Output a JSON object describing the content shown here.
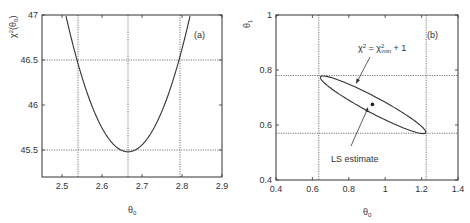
{
  "chart_data": [
    {
      "type": "line",
      "panel_label": "(a)",
      "title": "",
      "xlabel": "θ0",
      "ylabel": "χ²(θ0)",
      "xlim": [
        2.45,
        2.9
      ],
      "ylim": [
        45.2,
        47.0
      ],
      "x_ticks": [
        "2.5",
        "2.6",
        "2.7",
        "2.8",
        "2.9"
      ],
      "y_ticks": [
        "45.5",
        "46",
        "46.5",
        "47"
      ],
      "grid": false,
      "series": [
        {
          "name": "χ²(θ0) profile",
          "x": [
            2.5,
            2.54,
            2.58,
            2.62,
            2.665,
            2.71,
            2.75,
            2.795,
            2.82
          ],
          "y": [
            47.0,
            46.5,
            46.07,
            45.7,
            45.48,
            45.6,
            45.93,
            46.5,
            47.0
          ]
        }
      ],
      "reference_lines": {
        "horizontal": [
          46.5,
          45.5
        ],
        "vertical": [
          2.54,
          2.665,
          2.795
        ]
      },
      "minimum": {
        "x": 2.665,
        "y": 45.48
      }
    },
    {
      "type": "scatter",
      "panel_label": "(b)",
      "title": "",
      "xlabel": "θ0",
      "ylabel": "θ1",
      "xlim": [
        0.4,
        1.4
      ],
      "ylim": [
        0.4,
        1.0
      ],
      "x_ticks": [
        "0.4",
        "0.6",
        "0.8",
        "1",
        "1.2",
        "1.4"
      ],
      "y_ticks": [
        "0.4",
        "0.6",
        "0.8",
        "1"
      ],
      "grid": false,
      "series": [
        {
          "name": "LS estimate",
          "x": [
            0.93
          ],
          "y": [
            0.675
          ]
        },
        {
          "name": "χ² = χ²min + 1 contour (ellipse)",
          "x": [
            0.635,
            0.66,
            0.85,
            1.05,
            1.2,
            1.225,
            1.2,
            1.0,
            0.8,
            0.65,
            0.635
          ],
          "y": [
            0.765,
            0.78,
            0.73,
            0.655,
            0.59,
            0.57,
            0.57,
            0.615,
            0.68,
            0.75,
            0.765
          ]
        }
      ],
      "reference_lines": {
        "horizontal": [
          0.78,
          0.57
        ],
        "vertical": [
          0.635,
          1.225
        ]
      },
      "annotations": [
        "χ² = χ²min + 1",
        "LS estimate"
      ]
    }
  ],
  "panel_a": {
    "label": "(a)",
    "xlabel_main": "θ",
    "xlabel_sub": "0",
    "ylabel_main": "χ",
    "ylabel_sup": "2",
    "ylabel_arg": "(θ",
    "ylabel_arg_sub": "0",
    "ylabel_close": ")",
    "x_ticks": [
      {
        "label": "2.5",
        "value": 2.5
      },
      {
        "label": "2.6",
        "value": 2.6
      },
      {
        "label": "2.7",
        "value": 2.7
      },
      {
        "label": "2.8",
        "value": 2.8
      },
      {
        "label": "2.9",
        "value": 2.9
      }
    ],
    "y_ticks": [
      {
        "label": "45.5",
        "value": 45.5
      },
      {
        "label": "46",
        "value": 46.0
      },
      {
        "label": "46.5",
        "value": 46.5
      },
      {
        "label": "47",
        "value": 47.0
      }
    ]
  },
  "panel_b": {
    "label": "(b)",
    "xlabel_main": "θ",
    "xlabel_sub": "0",
    "ylabel_main": "θ",
    "ylabel_sub": "1",
    "contour_annotation_chi": "χ",
    "contour_annotation_sup": "2",
    "contour_annotation_eq": " = χ",
    "contour_annotation_sup2": "2",
    "contour_annotation_sub": "min",
    "contour_annotation_tail": " + 1",
    "estimate_annotation": "LS estimate",
    "x_ticks": [
      {
        "label": "0.4",
        "value": 0.4
      },
      {
        "label": "0.6",
        "value": 0.6
      },
      {
        "label": "0.8",
        "value": 0.8
      },
      {
        "label": "1",
        "value": 1.0
      },
      {
        "label": "1.2",
        "value": 1.2
      },
      {
        "label": "1.4",
        "value": 1.4
      }
    ],
    "y_ticks": [
      {
        "label": "0.4",
        "value": 0.4
      },
      {
        "label": "0.6",
        "value": 0.6
      },
      {
        "label": "0.8",
        "value": 0.8
      },
      {
        "label": "1",
        "value": 1.0
      }
    ]
  }
}
